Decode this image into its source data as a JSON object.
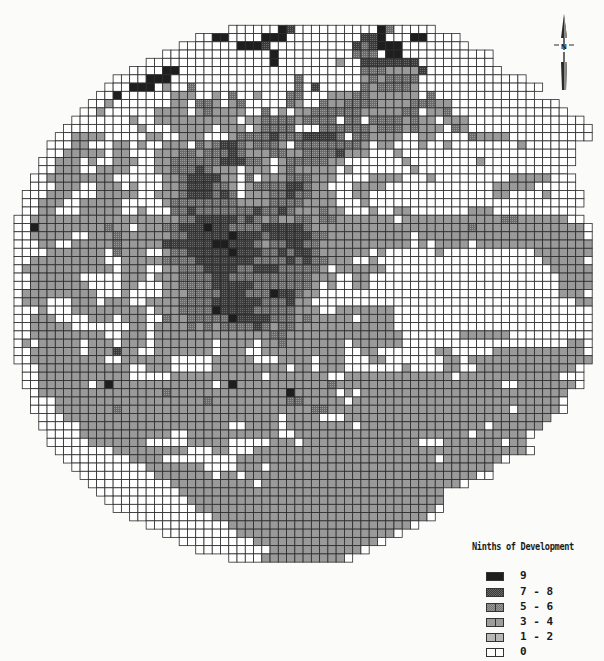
{
  "map": {
    "title": "Ninths of Development",
    "grid": {
      "origin_x": 14,
      "origin_y": 17,
      "cell_w": 8.26,
      "cell_h": 8.26,
      "cols": 70,
      "rows": 68,
      "center_col": 34.9,
      "center_row": 34,
      "radius_cells": 35.2,
      "line_color": "#2b2b2b",
      "encoding": "one char per cell; '.' outside circle; digits = legend class index (0 = '0', 1 = '1-2', 2 = '3-4', 3 = '5-6', 4 = '7-8', 5 = '9')",
      "rows_data": [
        "......................................................................",
        "..........................0000005400000000005300000..................",
        "......................00550000555000000000445000550000................",
        "....................00000005554000000000043455500000000..............",
        "..................0000000000000500000000033305500000000000............",
        "................000000000000000500000002004444444000000000............",
        "..............000055000000000000000000000033322224000000000..........",
        "............00005550000000000000003000000023233330000000000000........",
        "...........00055502003000000000000304000003233332000000000000000......",
        "..........00500000022200203002000330002223322222203000000000000......",
        ".........002000000022033202300000320032233332222333220000000000000....",
        "........00200000022220232222003020223333332222233022300000000000000...",
        ".......00000002002222222222022333323333033033332322022200000000000000.",
        "......0000000002000222220222023333000333333233323222032000000000000000",
        ".....00222200000220022200023333433344443033222200220000322220000000000",
        "....0002200022020022203234432333203333333320220002002000000002000000..",
        "....0022222022000222332333432223322333342220002000000000000000000000..",
        "...00222020022200223333334443320233333220000000200000000200000000000..",
        "...0022200222200022333432220222023222220200000002000000000000000000...",
        "..002222222200000022344442203022233322200002222000200000000022222000..",
        "..000222002220200022344433202333344322000222200000000000002222200000..",
        ".00022200022222002223444343022233433222002200000000000000022000020000.",
        ".00222002222200000233333333222233332222000200000000000000000000000000.",
        ".0022000222220020003343333333433432223220002002200000002220000000000..",
        "002222222222222222223344444343232233233222222202222222222223322222200.",
        "0052222222232202223344454433334444432222222222222222222322222222222220",
        "0022222002223222222334444454443444443322222222220222222222222222222220",
        "0002200222223222224444445544432334433222222222220202222022222222222222",
        "0000222222203222002334444454443343443222222020000002000000000002222222",
        "0022222222200222223333444444433334343322200200000000000000000000222220",
        "0222222222220222002233344443344433333202222220000000000000000000022222",
        "0022222200000222022233334433333333332220022000000000000000000000002222",
        "0022222220000220002233334444433333332020022000000000000000000000002222",
        "0222222222000200002223333444333544322000000000000000000000000000002220",
        "0222000222022200222233334444443334220000000000000000000000000000000022",
        "0002000222222222022233335444433333222002222222000000000000000000000000",
        "0022200002220222003223333354444333232222202222000000000000000000000000",
        "0022222000000022022223232333343233222222222222000000000000000000000000",
        "0022222222200222022222222222222332222222222222200000002222220000000000",
        "0202222202220222022222220222202232222222022222200000000000000000000220",
        "0022222202224220022222220222002222222222002200000002200000222222222220",
        "0022222222200222222000002222200022220222000220000000220222222222222222",
        ".00222222222220022200000222222222022022200000002000022002222222222220.",
        ".00222222222220000022222222222022222220022222222222220222222222222000.",
        ".00222222025222222222222025222222222223222222222222222222220022222220.",
        "..02222222222222223222222222222225222220202222222222222222222222222...",
        "..00022222222222222222232222222223322222022222222222222222222222220...",
        "..00022222223222222222222222222222223322222222222222222222220222220...",
        "...00022222222222222222222222222022220002222222222222222222222222.....",
        "...0000022222222222222222200222202222222202222222222222220222222......",
        "....00002222222222200222222222220022222222222222222222202222220.......",
        "....0000022222220000022222000002220222222222222220002222222022........",
        ".....0000000222222222000220002222222222222222222222222222222220.......",
        "......000000002222000000000222222222222222222222222022222220..........",
        ".......000000000222222200002220222222222222222222222222222............",
        "........00000000022222220220222222222222222222222222222200............",
        ".........0000000000222222222202222222222222222222222220...............",
        "..........000000000022222222222222222222222222222222..................",
        "...........00000000002222222222222222222222222222222..................",
        "............0000000000222222222222222222222222222220..................",
        "..............0000000000222222222222222222222222220...................",
        "................000000000022222222222222222222220.....................",
        "..................00000000022222222222222222220.......................",
        "....................0000000002222222222222220.........................",
        "......................000000000222222222220...........................",
        "..........................000022222222220............................",
        "................................................................. ....",
        "......................................................................"
      ]
    },
    "classes": [
      {
        "index": 0,
        "label": "0",
        "fill": "#ffffff"
      },
      {
        "index": 1,
        "label": "1 - 2",
        "fill": "#b3b3b3"
      },
      {
        "index": 2,
        "label": "3 - 4",
        "fill": "#9a9a9a"
      },
      {
        "index": 3,
        "label": "5 - 6",
        "fill": "#7a7a7a"
      },
      {
        "index": 4,
        "label": "7 - 8",
        "fill": "#4a4a4a"
      },
      {
        "index": 5,
        "label": "9",
        "fill": "#1e1e1e"
      }
    ],
    "north_arrow": {
      "label": "N"
    }
  },
  "legend": {
    "title": "Ninths of Development",
    "items": [
      {
        "label": "9",
        "fill": "#1e1e1e",
        "pattern": "solid"
      },
      {
        "label": "7 - 8",
        "fill": "#444444",
        "pattern": "dots"
      },
      {
        "label": "5 - 6",
        "fill": "#777777",
        "pattern": "dots"
      },
      {
        "label": "3 - 4",
        "fill": "#9d9d9d",
        "pattern": "solid"
      },
      {
        "label": "1 - 2",
        "fill": "#b8b8b8",
        "pattern": "solid"
      },
      {
        "label": "0",
        "fill": "#ffffff",
        "pattern": "solid"
      }
    ]
  }
}
